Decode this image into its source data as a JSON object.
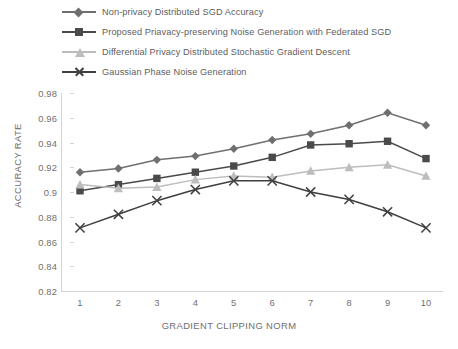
{
  "chart_data": {
    "type": "line",
    "title": "",
    "xlabel": "GRADIENT CLIPPING NORM",
    "ylabel": "ACCURACY RATE",
    "categories": [
      "1",
      "2",
      "3",
      "4",
      "5",
      "6",
      "7",
      "8",
      "9",
      "10"
    ],
    "x": [
      1,
      2,
      3,
      4,
      5,
      6,
      7,
      8,
      9,
      10
    ],
    "xlim": [
      1,
      10
    ],
    "ylim": [
      0.82,
      0.98
    ],
    "ytick_labels": [
      "0.98",
      "0.96",
      "0.94",
      "0.92",
      "0.9",
      "0.88",
      "0.86",
      "0.84",
      "0.82"
    ],
    "ytick_values": [
      0.98,
      0.96,
      0.94,
      0.92,
      0.9,
      0.88,
      0.86,
      0.84,
      0.82
    ],
    "grid": false,
    "legend_position": "top",
    "series": [
      {
        "name": "Non-privacy Distributed SGD Accuracy",
        "marker": "diamond",
        "color": "#6f6f6f",
        "values": [
          0.916,
          0.919,
          0.926,
          0.929,
          0.935,
          0.942,
          0.947,
          0.954,
          0.964,
          0.954
        ]
      },
      {
        "name": "Proposed Priavacy-preserving Noise Generation with Federated SGD",
        "marker": "square",
        "color": "#4a4a4a",
        "values": [
          0.901,
          0.906,
          0.911,
          0.916,
          0.921,
          0.928,
          0.938,
          0.939,
          0.941,
          0.927
        ]
      },
      {
        "name": "Differential Privacy Distributed Stochastic Gradient Descent",
        "marker": "triangle",
        "color": "#bdbdbd",
        "values": [
          0.906,
          0.903,
          0.904,
          0.91,
          0.913,
          0.912,
          0.917,
          0.92,
          0.922,
          0.913
        ]
      },
      {
        "name": "Gaussian Phase Noise Generation",
        "marker": "x",
        "color": "#3f3f3f",
        "values": [
          0.871,
          0.882,
          0.893,
          0.902,
          0.909,
          0.909,
          0.9,
          0.894,
          0.884,
          0.871
        ]
      }
    ]
  },
  "legend": {
    "items": [
      {
        "label": "Non-privacy Distributed SGD Accuracy",
        "marker": "diamond",
        "color": "#6f6f6f"
      },
      {
        "label": "Proposed Priavacy-preserving Noise Generation with Federated SGD",
        "marker": "square",
        "color": "#4a4a4a"
      },
      {
        "label": "Differential Privacy Distributed Stochastic Gradient Descent",
        "marker": "triangle",
        "color": "#bdbdbd"
      },
      {
        "label": "Gaussian Phase Noise Generation",
        "marker": "x",
        "color": "#3f3f3f"
      }
    ]
  },
  "axes": {
    "x_title": "GRADIENT CLIPPING NORM",
    "y_title": "ACCURACY RATE"
  }
}
